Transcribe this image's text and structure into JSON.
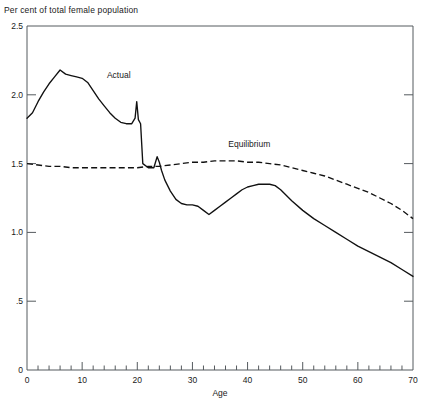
{
  "chart_data": {
    "type": "line",
    "title": "Per cent of total female population",
    "xlabel": "Age",
    "ylabel": "",
    "xlim": [
      0,
      70
    ],
    "ylim": [
      0,
      2.5
    ],
    "grid": false,
    "legend_position": "inline-annotation",
    "x_ticks_major": [
      0,
      10,
      20,
      30,
      40,
      50,
      60,
      70
    ],
    "x_tick_labels": [
      "0",
      "10",
      "20",
      "30",
      "40",
      "50",
      "60",
      "70"
    ],
    "x_minor_tick_step": 2,
    "y_ticks_major": [
      0,
      0.5,
      1.0,
      1.5,
      2.0,
      2.5
    ],
    "y_tick_labels": [
      "0",
      ".5",
      "1.0",
      "1.5",
      "2.0",
      "2.5"
    ],
    "annotations": [
      {
        "text": "Actual",
        "x": 14.5,
        "y": 2.12
      },
      {
        "text": "Equilibrium",
        "x": 36.5,
        "y": 1.62
      }
    ],
    "series": [
      {
        "name": "Actual",
        "style": "solid",
        "color": "#111111",
        "x": [
          0,
          1,
          2,
          3,
          4,
          5,
          6,
          7,
          8,
          9,
          10,
          11,
          12,
          13,
          14,
          15,
          16,
          17,
          18,
          19,
          19.6,
          19.9,
          20.2,
          20.6,
          21,
          22,
          23,
          23.6,
          24,
          24.4,
          25,
          26,
          27,
          28,
          29,
          30,
          31,
          32,
          33,
          34,
          35,
          36,
          37,
          38,
          39,
          40,
          41,
          42,
          43,
          44,
          45,
          46,
          47,
          48,
          50,
          52,
          54,
          56,
          58,
          60,
          62,
          64,
          66,
          68,
          70
        ],
        "y": [
          1.83,
          1.87,
          1.95,
          2.02,
          2.08,
          2.13,
          2.18,
          2.15,
          2.14,
          2.13,
          2.12,
          2.09,
          2.03,
          1.97,
          1.92,
          1.87,
          1.83,
          1.8,
          1.79,
          1.79,
          1.83,
          1.95,
          1.82,
          1.79,
          1.5,
          1.47,
          1.47,
          1.55,
          1.51,
          1.45,
          1.38,
          1.3,
          1.24,
          1.21,
          1.2,
          1.2,
          1.19,
          1.16,
          1.13,
          1.16,
          1.19,
          1.22,
          1.25,
          1.28,
          1.31,
          1.33,
          1.34,
          1.35,
          1.35,
          1.35,
          1.34,
          1.31,
          1.27,
          1.23,
          1.16,
          1.1,
          1.05,
          1.0,
          0.95,
          0.9,
          0.86,
          0.82,
          0.78,
          0.73,
          0.68
        ]
      },
      {
        "name": "Equilibrium",
        "style": "dashed",
        "color": "#111111",
        "x": [
          0,
          2,
          4,
          6,
          8,
          10,
          12,
          14,
          16,
          18,
          20,
          22,
          24,
          26,
          28,
          30,
          32,
          34,
          36,
          38,
          40,
          42,
          44,
          46,
          48,
          50,
          52,
          54,
          56,
          58,
          60,
          62,
          64,
          66,
          68,
          70
        ],
        "y": [
          1.5,
          1.49,
          1.48,
          1.48,
          1.47,
          1.47,
          1.47,
          1.47,
          1.47,
          1.47,
          1.47,
          1.48,
          1.48,
          1.49,
          1.5,
          1.51,
          1.51,
          1.52,
          1.52,
          1.52,
          1.51,
          1.51,
          1.5,
          1.49,
          1.47,
          1.45,
          1.43,
          1.41,
          1.38,
          1.35,
          1.32,
          1.29,
          1.25,
          1.21,
          1.16,
          1.1
        ]
      }
    ]
  }
}
